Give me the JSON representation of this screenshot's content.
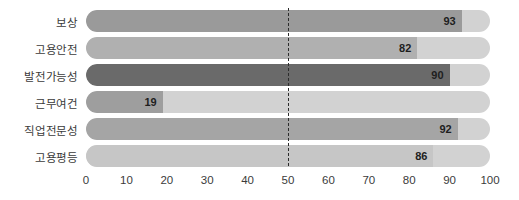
{
  "chart_data": {
    "type": "bar",
    "orientation": "horizontal",
    "title": "",
    "xlabel": "",
    "ylabel": "",
    "xlim": [
      0,
      100
    ],
    "xticks": [
      0,
      10,
      20,
      30,
      40,
      50,
      60,
      70,
      80,
      90,
      100
    ],
    "xtick_labels": [
      "0",
      "10",
      "20",
      "30",
      "40",
      "50",
      "60",
      "70",
      "80",
      "90",
      "100"
    ],
    "grid": false,
    "legend": "none",
    "reference_line": {
      "value": 50,
      "label": "50",
      "style": "dashed",
      "color": "#2b2b2b"
    },
    "track_color": "#d2d2d2",
    "categories": [
      "보상",
      "고용안전",
      "발전가능성",
      "근무여건",
      "직업전문성",
      "고용평등"
    ],
    "values": [
      93,
      82,
      90,
      19,
      92,
      86
    ],
    "value_labels": [
      "93",
      "82",
      "90",
      "19",
      "92",
      "86"
    ],
    "bar_colors": [
      "#9a9a9a",
      "#b0b0b0",
      "#6a6a6a",
      "#9e9e9e",
      "#a5a5a5",
      "#c6c6c6"
    ],
    "bars": [
      {
        "category": "보상",
        "value": 93,
        "label": "93",
        "color": "#9a9a9a"
      },
      {
        "category": "고용안전",
        "value": 82,
        "label": "82",
        "color": "#b0b0b0"
      },
      {
        "category": "발전가능성",
        "value": 90,
        "label": "90",
        "color": "#6a6a6a"
      },
      {
        "category": "근무여건",
        "value": 19,
        "label": "19",
        "color": "#9e9e9e"
      },
      {
        "category": "직업전문성",
        "value": 92,
        "label": "92",
        "color": "#a5a5a5"
      },
      {
        "category": "고용평등",
        "value": 86,
        "label": "86",
        "color": "#c6c6c6"
      }
    ]
  }
}
